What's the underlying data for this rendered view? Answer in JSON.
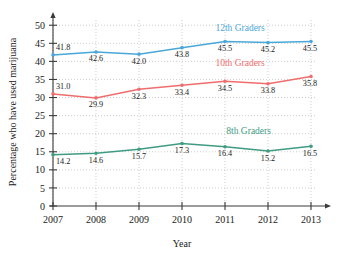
{
  "chart_data": {
    "type": "line",
    "title": "",
    "xlabel": "Year",
    "ylabel": "Percentage who have used marijuana",
    "categories": [
      "2007",
      "2008",
      "2009",
      "2010",
      "2011",
      "2012",
      "2013"
    ],
    "x": [
      2007,
      2008,
      2009,
      2010,
      2011,
      2012,
      2013
    ],
    "xlim": [
      2007,
      2013
    ],
    "ylim": [
      0,
      52
    ],
    "yticks": [
      0,
      5,
      10,
      15,
      20,
      25,
      30,
      35,
      40,
      45,
      50
    ],
    "ytick_labels": [
      "0",
      "5",
      "10",
      "15",
      "20",
      "25",
      "30",
      "35",
      "40",
      "45",
      "50"
    ],
    "grid": true,
    "legend_position": "inline-right",
    "series": [
      {
        "name": "12th Graders",
        "color": "#4aa8d8",
        "values": [
          41.8,
          42.6,
          42.0,
          43.8,
          45.5,
          45.2,
          45.5
        ],
        "value_labels": [
          "41.8",
          "42.6",
          "42.0",
          "43.8",
          "45.5",
          "45.2",
          "45.5"
        ],
        "label_positions": [
          "above",
          "below",
          "below",
          "below",
          "below",
          "below",
          "below"
        ],
        "legend_x": 2011.35,
        "legend_y": 48.3
      },
      {
        "name": "10th Graders",
        "color": "#ef6d6d",
        "values": [
          31.0,
          29.9,
          32.3,
          33.4,
          34.5,
          33.8,
          35.8
        ],
        "value_labels": [
          "31.0",
          "29.9",
          "32.3",
          "33.4",
          "34.5",
          "33.8",
          "35.8"
        ],
        "label_positions": [
          "above",
          "below",
          "below",
          "below",
          "below",
          "below",
          "below"
        ],
        "legend_x": 2011.35,
        "legend_y": 38.6
      },
      {
        "name": "8th Graders",
        "color": "#3f9c82",
        "values": [
          14.2,
          14.6,
          15.7,
          17.3,
          16.4,
          15.2,
          16.5
        ],
        "value_labels": [
          "14.2",
          "14.6",
          "15.7",
          "17.3",
          "16.4",
          "15.2",
          "16.5"
        ],
        "label_positions": [
          "below",
          "below",
          "below",
          "below",
          "below",
          "below",
          "below"
        ],
        "legend_x": 2011.55,
        "legend_y": 20.0
      }
    ]
  }
}
